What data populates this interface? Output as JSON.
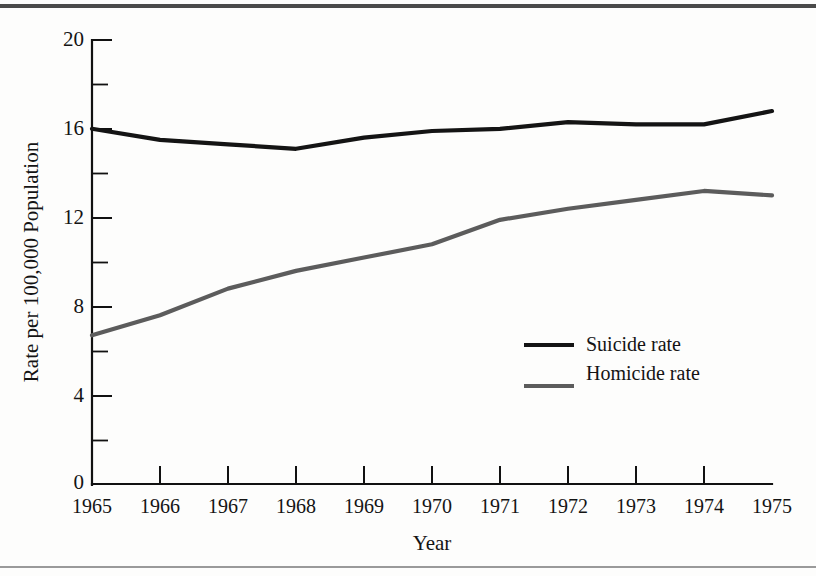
{
  "figure": {
    "background_color": "#fdfdfc",
    "rule_top_color": "#4a4a4a",
    "rule_bottom_color": "#9a9a9a"
  },
  "chart_data": {
    "type": "line",
    "title": "",
    "subtitle": "",
    "xlabel": "Year",
    "ylabel": "Rate per 100,000 Population",
    "x": [
      1965,
      1966,
      1967,
      1968,
      1969,
      1970,
      1971,
      1972,
      1973,
      1974,
      1975
    ],
    "xtick_labels": [
      "1965",
      "1966",
      "1967",
      "1968",
      "1969",
      "1970",
      "1971",
      "1972",
      "1973",
      "1974",
      "1975"
    ],
    "ytick_labels": [
      "0",
      "4",
      "8",
      "12",
      "16",
      "20"
    ],
    "ytick_values": [
      0,
      4,
      8,
      12,
      16,
      20
    ],
    "yminor_ticks": [
      2,
      6,
      10,
      14,
      18
    ],
    "xlim": [
      1965,
      1975
    ],
    "ylim": [
      0,
      20
    ],
    "grid": false,
    "legend_position": "center-right",
    "series": [
      {
        "name": "Suicide rate",
        "color": "#141414",
        "values": [
          16.0,
          15.5,
          15.3,
          15.1,
          15.6,
          15.9,
          16.0,
          16.3,
          16.2,
          16.2,
          16.8
        ]
      },
      {
        "name": "Homicide rate",
        "color": "#5c5c5c",
        "values": [
          6.7,
          7.6,
          8.8,
          9.6,
          10.2,
          10.8,
          11.9,
          12.4,
          12.8,
          13.2,
          13.0
        ]
      }
    ]
  },
  "legend": {
    "entries": [
      {
        "label": "Suicide rate",
        "color": "#141414"
      },
      {
        "label": "Homicide rate",
        "color": "#5c5c5c"
      }
    ]
  }
}
